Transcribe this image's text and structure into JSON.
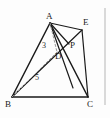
{
  "figure": {
    "background_color": "#fdfdfd",
    "stroke_color": "#1a1a1a",
    "dashed_color": "#9a9a9a",
    "vertices": [
      {
        "id": "A",
        "label": "A",
        "x": 50,
        "y": 23,
        "label_x": 46,
        "label_y": 12
      },
      {
        "id": "B",
        "label": "B",
        "x": 12,
        "y": 97,
        "label_x": 5,
        "label_y": 100
      },
      {
        "id": "C",
        "label": "C",
        "x": 88,
        "y": 97,
        "label_x": 87,
        "label_y": 100
      },
      {
        "id": "D",
        "label": "D",
        "x": 57,
        "y": 52,
        "label_x": 55,
        "label_y": 52
      },
      {
        "id": "E",
        "label": "E",
        "x": 82,
        "y": 30,
        "label_x": 83,
        "label_y": 18
      },
      {
        "id": "P",
        "label": "P",
        "x": 69,
        "y": 44,
        "label_x": 70,
        "label_y": 41
      }
    ],
    "solid_edges": [
      {
        "name": "edge-A-B",
        "from": "A",
        "to": "B"
      },
      {
        "name": "edge-A-C",
        "from": "A",
        "to": "C"
      },
      {
        "name": "edge-B-C",
        "from": "B",
        "to": "C"
      },
      {
        "name": "edge-A-E",
        "from": "A",
        "to": "E"
      },
      {
        "name": "edge-E-C",
        "from": "E",
        "to": "C"
      },
      {
        "name": "edge-A-P",
        "from": "A",
        "to": "P"
      },
      {
        "name": "edge-B-E",
        "from": "B",
        "to": "E"
      },
      {
        "name": "edge-D-C",
        "from": "D",
        "to": "C"
      }
    ],
    "dashed_edges": [
      {
        "name": "edge-A-D",
        "from": "A",
        "to": "D"
      },
      {
        "name": "edge-B-D",
        "from": "B",
        "to": "D"
      }
    ],
    "measures": [
      {
        "name": "measure-AD",
        "label": "3",
        "x": 42,
        "y": 41,
        "edge": "A-D"
      },
      {
        "name": "measure-BD",
        "label": "5",
        "x": 35,
        "y": 73,
        "edge": "B-D"
      }
    ],
    "right_border": {
      "name": "right-rule",
      "x": 105,
      "y_start": 8,
      "y_end": 105,
      "color": "#b5b5b5"
    }
  }
}
